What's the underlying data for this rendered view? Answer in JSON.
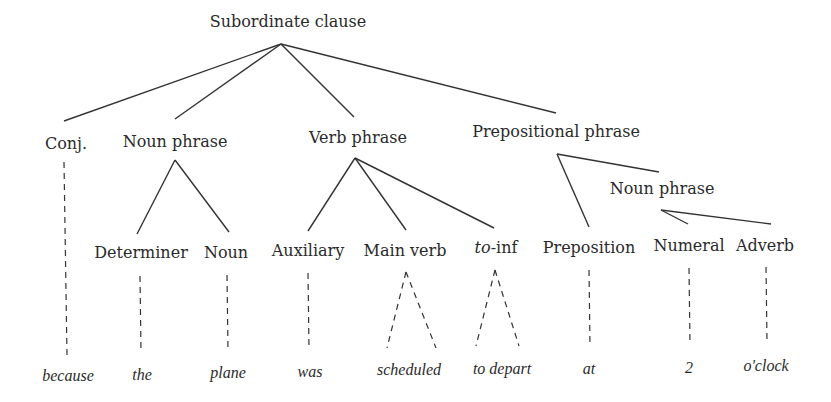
{
  "diagram": {
    "type": "syntax-tree",
    "root": {
      "label": "Subordinate clause",
      "x": 288,
      "y": 14
    },
    "phrases": [
      {
        "id": "conj",
        "label": "Conj.",
        "x": 66,
        "y": 136
      },
      {
        "id": "np1",
        "label": "Noun phrase",
        "x": 175,
        "y": 134
      },
      {
        "id": "vp",
        "label": "Verb phrase",
        "x": 358,
        "y": 130
      },
      {
        "id": "pp",
        "label": "Prepositional phrase",
        "x": 556,
        "y": 124
      },
      {
        "id": "np2",
        "label": "Noun phrase",
        "x": 662,
        "y": 181
      }
    ],
    "terminals": [
      {
        "id": "det",
        "label": "Determiner",
        "x": 141,
        "y": 245
      },
      {
        "id": "noun",
        "label": "Noun",
        "x": 226,
        "y": 245
      },
      {
        "id": "aux",
        "label": "Auxiliary",
        "x": 308,
        "y": 243
      },
      {
        "id": "mainverb",
        "label": "Main verb",
        "x": 405,
        "y": 243
      },
      {
        "id": "toinf",
        "label": "to-inf",
        "label_italic_part": "to",
        "label_roman_part": "-inf",
        "x": 496,
        "y": 240
      },
      {
        "id": "prep",
        "label": "Preposition",
        "x": 589,
        "y": 240
      },
      {
        "id": "num",
        "label": "Numeral",
        "x": 689,
        "y": 238
      },
      {
        "id": "adv",
        "label": "Adverb",
        "x": 765,
        "y": 238
      }
    ],
    "words": [
      {
        "text": "because",
        "x": 68,
        "y": 368
      },
      {
        "text": "the",
        "x": 142,
        "y": 367
      },
      {
        "text": "plane",
        "x": 228,
        "y": 365
      },
      {
        "text": "was",
        "x": 310,
        "y": 364
      },
      {
        "text": "scheduled",
        "x": 409,
        "y": 362
      },
      {
        "text": "to depart",
        "x": 502,
        "y": 361
      },
      {
        "text": "at",
        "x": 589,
        "y": 361
      },
      {
        "text": "2",
        "x": 689,
        "y": 360
      },
      {
        "text": "o'clock",
        "x": 766,
        "y": 358
      }
    ],
    "colors": {
      "line": "#333333",
      "text": "#2a2a2a",
      "background": "#ffffff"
    }
  }
}
